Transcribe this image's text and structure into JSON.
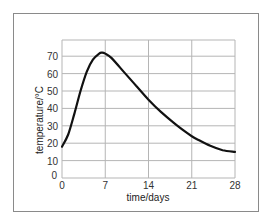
{
  "chart_data": {
    "type": "line",
    "title": "",
    "xlabel": "time/days",
    "ylabel": "temperature/°C",
    "xlim": [
      0,
      28
    ],
    "ylim": [
      0,
      80
    ],
    "grid": true,
    "legend": null,
    "x_ticks": [
      0,
      7,
      14,
      21,
      28
    ],
    "y_ticks": [
      0,
      10,
      20,
      30,
      40,
      50,
      60,
      70
    ],
    "series": [
      {
        "name": "temperature",
        "color": "#111111",
        "x": [
          0,
          1,
          2,
          3,
          4,
          5,
          6,
          6.5,
          7,
          8,
          10,
          12,
          14,
          16,
          18,
          20,
          21,
          22,
          24,
          26,
          28
        ],
        "y": [
          18,
          25,
          37,
          50,
          61,
          68,
          71.5,
          72,
          71.5,
          69,
          61,
          53,
          45,
          38,
          32,
          26.5,
          24,
          22,
          18.5,
          16,
          15
        ]
      }
    ]
  },
  "axis": {
    "xlabel": "time/days",
    "ylabel": "temperature/°C",
    "x_tick_labels": [
      "0",
      "7",
      "14",
      "21",
      "28"
    ],
    "y_tick_labels": [
      "0",
      "10",
      "20",
      "30",
      "40",
      "50",
      "60",
      "70"
    ]
  }
}
